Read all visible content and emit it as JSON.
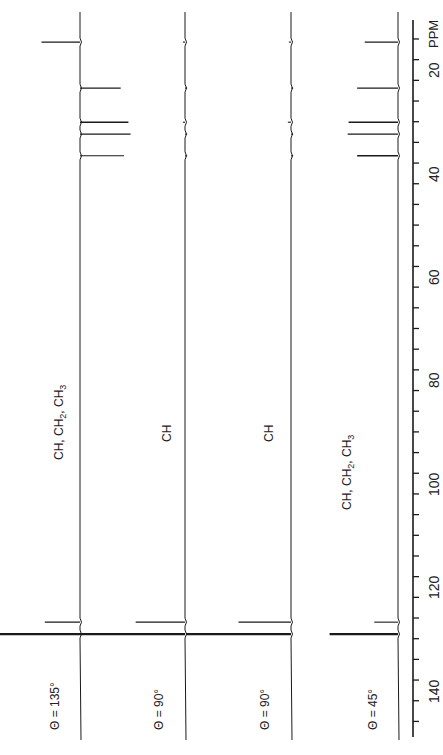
{
  "chart_data": {
    "type": "line",
    "title": "",
    "orientation": "rotated-90-ccw",
    "xlabel": "PPM",
    "ylabel": "",
    "xlim": [
      10,
      148
    ],
    "x_reversed": false,
    "axis": {
      "label": "PPM",
      "major_ticks": [
        20,
        40,
        60,
        80,
        100,
        120,
        140
      ],
      "minor_tick_step": 4
    },
    "series": [
      {
        "name": "θ = 135°",
        "label": "θ = 135°",
        "assignment": "CH, CH2, CH3",
        "peaks": [
          {
            "ppm": 14.6,
            "intensity": -0.35
          },
          {
            "ppm": 23.5,
            "intensity": 0.37
          },
          {
            "ppm": 30.1,
            "intensity": 0.44
          },
          {
            "ppm": 32.4,
            "intensity": 0.46
          },
          {
            "ppm": 36.6,
            "intensity": 0.4
          },
          {
            "ppm": 126.8,
            "intensity": -0.32
          },
          {
            "ppm": 129.1,
            "intensity": -0.8
          }
        ]
      },
      {
        "name": "θ = 90°",
        "label": "θ = 90°",
        "assignment": "CH",
        "peaks": [
          {
            "ppm": 14.6,
            "intensity": -0.02
          },
          {
            "ppm": 23.5,
            "intensity": 0.02
          },
          {
            "ppm": 30.1,
            "intensity": -0.02
          },
          {
            "ppm": 32.4,
            "intensity": 0.02
          },
          {
            "ppm": 36.6,
            "intensity": 0.02
          },
          {
            "ppm": 126.8,
            "intensity": -0.47
          },
          {
            "ppm": 129.1,
            "intensity": -1.0
          }
        ]
      },
      {
        "name": "θ = 90° (2)",
        "label": "θ = 90°",
        "assignment": "CH",
        "peaks": [
          {
            "ppm": 14.6,
            "intensity": -0.02
          },
          {
            "ppm": 23.5,
            "intensity": 0.02
          },
          {
            "ppm": 30.1,
            "intensity": -0.03
          },
          {
            "ppm": 32.4,
            "intensity": 0.02
          },
          {
            "ppm": 36.6,
            "intensity": 0.02
          },
          {
            "ppm": 126.8,
            "intensity": -0.5
          },
          {
            "ppm": 129.1,
            "intensity": -1.0
          }
        ]
      },
      {
        "name": "θ = 45°",
        "label": "θ = 45°",
        "assignment": "CH, CH2, CH3",
        "peaks": [
          {
            "ppm": 14.6,
            "intensity": -0.35
          },
          {
            "ppm": 23.5,
            "intensity": -0.43
          },
          {
            "ppm": 30.1,
            "intensity": -0.52
          },
          {
            "ppm": 32.4,
            "intensity": -0.53
          },
          {
            "ppm": 36.6,
            "intensity": -0.43
          },
          {
            "ppm": 126.8,
            "intensity": -0.25
          },
          {
            "ppm": 129.1,
            "intensity": -0.72
          }
        ]
      }
    ],
    "grid": false,
    "legend": "none"
  },
  "labels": {
    "axis_unit": "PPM",
    "spectra": [
      {
        "theta": "θ = 135°",
        "assignment": "CH, CH₂, CH₃"
      },
      {
        "theta": "θ = 90°",
        "assignment": "CH"
      },
      {
        "theta": "θ = 90°",
        "assignment": "CH"
      },
      {
        "theta": "θ = 45°",
        "assignment": "CH, CH₂, CH₃"
      }
    ],
    "ticks": [
      "20",
      "40",
      "60",
      "80",
      "100",
      "120",
      "140"
    ]
  },
  "colors": {
    "ink": "#1a1a1a",
    "background": "#ffffff"
  }
}
